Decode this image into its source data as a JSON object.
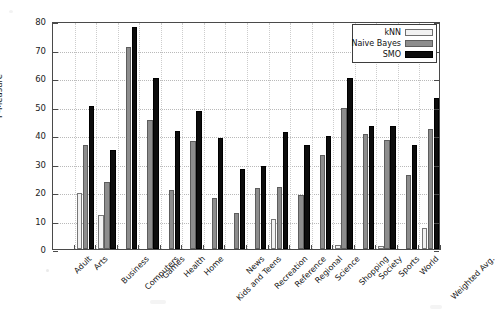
{
  "chart_data": {
    "type": "bar",
    "title": "",
    "xlabel": "",
    "ylabel": "F-Measure",
    "ylim": [
      0,
      80
    ],
    "ytick_step": 10,
    "yticks": [
      0,
      10,
      20,
      30,
      40,
      50,
      60,
      70,
      80
    ],
    "grid": true,
    "legend_position": "top-right",
    "categories": [
      "Adult",
      "Arts",
      "Business",
      "Computers",
      "Games",
      "Health",
      "Home",
      "Kids and Teens",
      "News",
      "Recreation",
      "Reference",
      "Regional",
      "Science",
      "Shopping",
      "Society",
      "Sports",
      "World",
      "Weighted Avg."
    ],
    "series": [
      {
        "name": "kNN",
        "color": "#f2f2f2",
        "values": [
          0,
          19.5,
          12.0,
          0,
          0,
          0,
          0,
          0,
          0,
          0,
          10.7,
          0,
          0,
          1.5,
          0,
          1.2,
          0,
          7.2
        ]
      },
      {
        "name": "Naive Bayes",
        "color": "#8d8d8d",
        "values": [
          0,
          36.5,
          23.4,
          70.9,
          45.1,
          20.7,
          38.0,
          17.9,
          12.7,
          21.3,
          21.8,
          19.0,
          33.1,
          49.4,
          40.4,
          38.1,
          25.9,
          42.1
        ]
      },
      {
        "name": "SMO",
        "color": "#0d0d0d",
        "values": [
          0,
          50.1,
          34.6,
          78.0,
          60.1,
          41.3,
          48.3,
          39.1,
          28.0,
          29.1,
          41.0,
          36.4,
          39.6,
          59.9,
          43.0,
          43.0,
          36.4,
          52.9
        ]
      }
    ]
  },
  "legend": {
    "entries": [
      {
        "label": "kNN",
        "swatch": "knn"
      },
      {
        "label": "Naive Bayes",
        "swatch": "nb"
      },
      {
        "label": "SMO",
        "swatch": "smo"
      }
    ]
  },
  "axes": {
    "y_axis_title": "F-Measure"
  }
}
